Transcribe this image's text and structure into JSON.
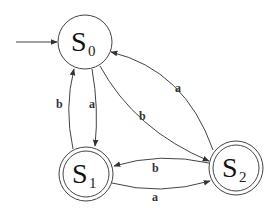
{
  "diagram": {
    "type": "finite-state-automaton",
    "colors": {
      "stroke": "#444444",
      "text": "#111111",
      "background": "#ffffff"
    },
    "start_state": "S0",
    "states": [
      {
        "id": "S0",
        "letter": "S",
        "subscript": "0",
        "accepting": false,
        "cx": 85,
        "cy": 42
      },
      {
        "id": "S1",
        "letter": "S",
        "subscript": "1",
        "accepting": true,
        "cx": 86,
        "cy": 174
      },
      {
        "id": "S2",
        "letter": "S",
        "subscript": "2",
        "accepting": true,
        "cx": 236,
        "cy": 168
      }
    ],
    "transitions": [
      {
        "from": "S0",
        "to": "S1",
        "label": "a"
      },
      {
        "from": "S1",
        "to": "S0",
        "label": "b"
      },
      {
        "from": "S0",
        "to": "S2",
        "label": "b"
      },
      {
        "from": "S2",
        "to": "S0",
        "label": "a"
      },
      {
        "from": "S2",
        "to": "S1",
        "label": "b"
      },
      {
        "from": "S1",
        "to": "S2",
        "label": "a"
      }
    ]
  }
}
